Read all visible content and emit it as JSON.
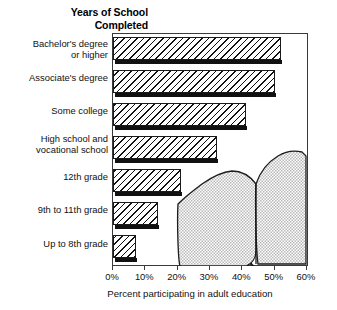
{
  "chart_data": {
    "type": "bar",
    "orientation": "horizontal",
    "title": "Years of School\nCompleted",
    "xlabel": "Percent participating in adult education",
    "ylabel": "Years of School Completed",
    "categories": [
      "Bachelor's degree\nor higher",
      "Associate's degree",
      "Some college",
      "High school and\nvocational school",
      "12th grade",
      "9th to 11th grade",
      "Up to 8th grade"
    ],
    "values": [
      52,
      50,
      41,
      32,
      21,
      14,
      7
    ],
    "xlim": [
      0,
      60
    ],
    "xticks": [
      0,
      10,
      20,
      30,
      40,
      50,
      60
    ],
    "xticklabels": [
      "0%",
      "10%",
      "20%",
      "30%",
      "40%",
      "50%",
      "60%"
    ],
    "grid": false,
    "legend": false,
    "bar_fill": "diagonal-hatch",
    "bar_edge_color": "#1a1a1a",
    "shadow_color": "#111111",
    "frame_color": "#3a3a3a",
    "background": "#ffffff",
    "decoration": "open-book-illustration"
  },
  "axis": {
    "x_title": "Percent participating in adult education",
    "ticks": [
      {
        "label": "0%",
        "value": 0
      },
      {
        "label": "10%",
        "value": 10
      },
      {
        "label": "20%",
        "value": 20
      },
      {
        "label": "30%",
        "value": 30
      },
      {
        "label": "40%",
        "value": 40
      },
      {
        "label": "50%",
        "value": 50
      },
      {
        "label": "60%",
        "value": 60
      }
    ]
  },
  "header": {
    "title": "Years of School\nCompleted"
  },
  "icons": {
    "decoration": "open-book-icon"
  }
}
